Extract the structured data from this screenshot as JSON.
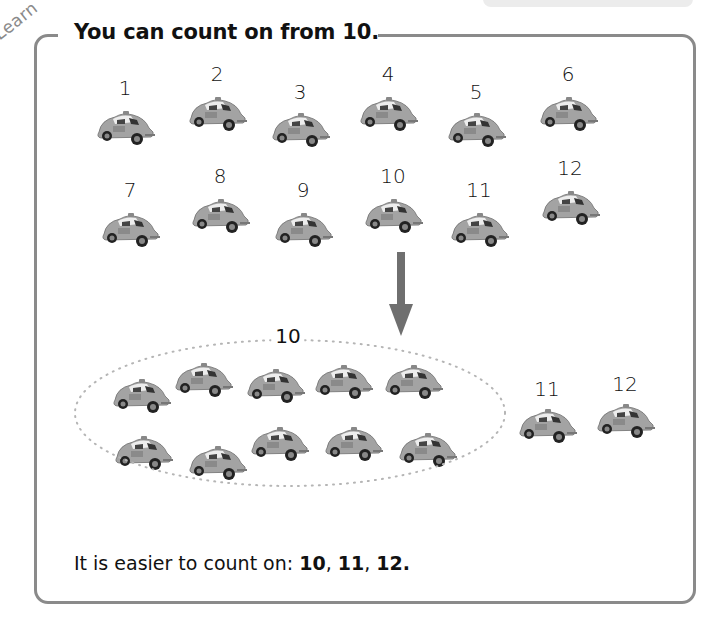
{
  "section": {
    "tag": "Learn",
    "title": "You can count on from 10."
  },
  "rows": {
    "row1": [
      {
        "label": "1",
        "x": 125,
        "ny": 76,
        "cy": 108
      },
      {
        "label": "2",
        "x": 217,
        "ny": 62,
        "cy": 94
      },
      {
        "label": "3",
        "x": 300,
        "ny": 80,
        "cy": 110
      },
      {
        "label": "4",
        "x": 388,
        "ny": 62,
        "cy": 94
      },
      {
        "label": "5",
        "x": 476,
        "ny": 80,
        "cy": 110
      },
      {
        "label": "6",
        "x": 568,
        "ny": 62,
        "cy": 94
      }
    ],
    "row2": [
      {
        "label": "7",
        "x": 130,
        "ny": 178,
        "cy": 210
      },
      {
        "label": "8",
        "x": 220,
        "ny": 164,
        "cy": 196
      },
      {
        "label": "9",
        "x": 303,
        "ny": 178,
        "cy": 210
      },
      {
        "label": "10",
        "x": 393,
        "ny": 164,
        "cy": 196
      },
      {
        "label": "11",
        "x": 479,
        "ny": 178,
        "cy": 210
      },
      {
        "label": "12",
        "x": 570,
        "ny": 156,
        "cy": 188
      }
    ]
  },
  "group": {
    "label": "10",
    "cars": [
      {
        "x": 141,
        "y": 376
      },
      {
        "x": 203,
        "y": 360
      },
      {
        "x": 275,
        "y": 366
      },
      {
        "x": 343,
        "y": 362
      },
      {
        "x": 413,
        "y": 362
      },
      {
        "x": 143,
        "y": 433
      },
      {
        "x": 217,
        "y": 443
      },
      {
        "x": 279,
        "y": 424
      },
      {
        "x": 353,
        "y": 424
      },
      {
        "x": 427,
        "y": 430
      }
    ]
  },
  "extra": [
    {
      "label": "11",
      "x": 547,
      "ny": 377,
      "cy": 406
    },
    {
      "label": "12",
      "x": 625,
      "ny": 372,
      "cy": 401
    }
  ],
  "conclusion": {
    "prefix": "It is easier to count on: ",
    "n1": "10",
    "sep1": ", ",
    "n2": "11",
    "sep2": ", ",
    "n3": "12."
  },
  "colors": {
    "frame": "#8a8a8a",
    "car_body": "#9a9a9a",
    "arrow": "#6f6f6f"
  }
}
